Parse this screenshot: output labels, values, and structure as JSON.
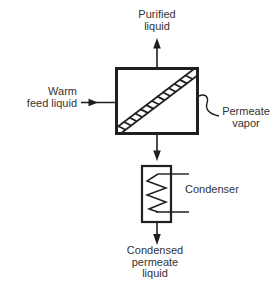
{
  "diagram": {
    "type": "pervaporation-membrane-process-flow",
    "labels": {
      "purified": {
        "line1": "Purified",
        "line2": "liquid"
      },
      "feed": {
        "line1": "Warm",
        "line2": "feed liquid"
      },
      "permeate": {
        "line1": "Permeate",
        "line2": "vapor"
      },
      "condenser": {
        "label": "Condenser"
      },
      "condensed": {
        "line1": "Condensed",
        "line2": "permeate",
        "line3": "liquid"
      }
    },
    "colors": {
      "line": "#1f1f1f",
      "text": "#333333",
      "background": "#ffffff"
    }
  }
}
